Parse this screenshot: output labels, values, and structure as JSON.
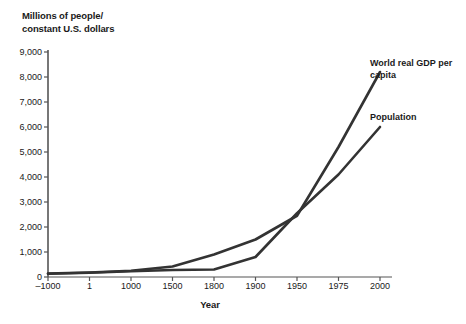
{
  "chart_data": {
    "type": "line",
    "title": "",
    "ylabel": "Millions of people/\nconstant U.S. dollars",
    "xlabel": "Year",
    "categories": [
      "-1000",
      "1",
      "1000",
      "1500",
      "1800",
      "1900",
      "1950",
      "1975",
      "2000"
    ],
    "x_tick_labels": [
      "–1000",
      "1",
      "1000",
      "1500",
      "1800",
      "1900",
      "1950",
      "1975",
      "2000"
    ],
    "y_tick_labels": [
      "0",
      "1,000",
      "2,000",
      "3,000",
      "4,000",
      "5,000",
      "6,000",
      "7,000",
      "8,000",
      "9,000"
    ],
    "y_tick_values": [
      0,
      1000,
      2000,
      3000,
      4000,
      5000,
      6000,
      7000,
      8000,
      9000
    ],
    "ylim": [
      0,
      9000
    ],
    "grid": false,
    "legend_position": "right-inline",
    "line_color": "#333333",
    "series": [
      {
        "name": "World real GDP per capita",
        "values": [
          140,
          180,
          250,
          420,
          900,
          1500,
          2450,
          5200,
          8200
        ]
      },
      {
        "name": "Population",
        "values": [
          130,
          170,
          230,
          280,
          300,
          800,
          2550,
          4100,
          6000
        ]
      }
    ]
  },
  "labels": {
    "y_axis_title": "Millions of people/\nconstant U.S. dollars",
    "x_axis_title": "Year",
    "series_gdp": "World real GDP per\ncapita",
    "series_population": "Population"
  }
}
